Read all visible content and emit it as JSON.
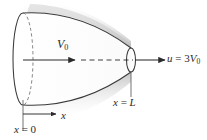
{
  "figure": {
    "type": "engineering-diagram",
    "width": 207,
    "height": 140,
    "background_color": "#ffffff",
    "line_color": "#2b2b2b",
    "shade_color": "#b8b8b8"
  },
  "labels": {
    "inlet_velocity": {
      "symbol": "V",
      "subscript": "0",
      "text": "V0"
    },
    "outlet_velocity": {
      "variable": "u",
      "equals": " = ",
      "coefficient": "3",
      "symbol": "V",
      "subscript": "0",
      "text": "u = 3V0"
    },
    "outlet_station": {
      "variable": "x",
      "equals": " = ",
      "value": "L",
      "text": "x = L"
    },
    "inlet_station": {
      "variable": "x",
      "equals": " = ",
      "value": "0",
      "text": "x = 0"
    },
    "axis": {
      "name": "x",
      "text": "x"
    }
  },
  "geometry": {
    "inlet_ellipse": {
      "cx": 23,
      "cy": 59,
      "rx": 10,
      "ry": 46
    },
    "outlet_ellipse": {
      "cx": 131,
      "cy": 60,
      "rx": 4.5,
      "ry": 12
    },
    "centerline": {
      "x_start": 23,
      "x_end": 131,
      "y": 60,
      "style": "dashed"
    },
    "inlet_arrow": {
      "x_start": 23,
      "x_end": 76,
      "y": 60
    },
    "outlet_arrow": {
      "x_start": 138,
      "x_end": 166,
      "y": 60
    },
    "x_axis_arrow": {
      "x_start": 23,
      "x_end": 56,
      "y": 114
    },
    "station_line_x0": {
      "x": 23,
      "y_start": 100,
      "y_end": 131
    },
    "station_line_xL": {
      "x": 131,
      "y_start": 72,
      "y_end": 98
    }
  }
}
